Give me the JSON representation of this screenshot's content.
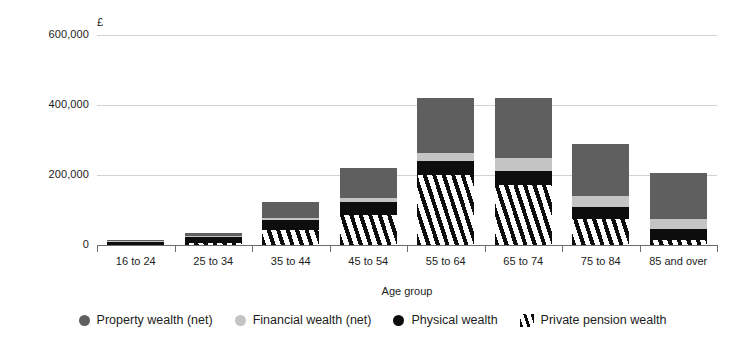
{
  "chart_data": {
    "type": "bar",
    "subtype": "stacked",
    "title": "",
    "xlabel": "Age group",
    "ylabel": "",
    "y_unit": "£",
    "ylim": [
      0,
      620000
    ],
    "yticks": [
      0,
      200000,
      400000,
      600000
    ],
    "ytick_labels": [
      "0",
      "200,000",
      "400,000",
      "600,000"
    ],
    "grid": true,
    "legend_position": "bottom",
    "categories": [
      "16 to 24",
      "25 to 34",
      "35 to 44",
      "45 to 54",
      "55 to 64",
      "65 to 74",
      "75 to 84",
      "85 and over"
    ],
    "series": [
      {
        "name": "Private pension wealth",
        "color": "#0d0d0d",
        "pattern": "diagonal-stripes",
        "values": [
          1000,
          6000,
          43000,
          86000,
          200000,
          172000,
          74000,
          14000
        ]
      },
      {
        "name": "Physical wealth",
        "color": "#0d0d0d",
        "pattern": "solid",
        "values": [
          8000,
          17000,
          29000,
          37000,
          40000,
          40000,
          34000,
          31000
        ]
      },
      {
        "name": "Financial wealth (net)",
        "color": "#c4c4c4",
        "pattern": "solid",
        "values": [
          2000,
          3000,
          5000,
          11000,
          23000,
          37000,
          31000,
          29000
        ]
      },
      {
        "name": "Property wealth (net)",
        "color": "#5f5f5f",
        "pattern": "solid",
        "values": [
          1000,
          8000,
          46000,
          86000,
          157000,
          171000,
          149000,
          131000
        ]
      }
    ],
    "totals": [
      12000,
      34000,
      123000,
      220000,
      420000,
      420000,
      288000,
      205000
    ]
  },
  "axis": {
    "y_unit_symbol": "£",
    "x_title": "Age group"
  },
  "legend": {
    "items": [
      {
        "label": "Property wealth (net)",
        "marker": "circle-dark-gray",
        "color": "#5f5f5f"
      },
      {
        "label": "Financial wealth (net)",
        "marker": "circle-light-gray",
        "color": "#c4c4c4"
      },
      {
        "label": "Physical wealth",
        "marker": "circle-black",
        "color": "#0d0d0d"
      },
      {
        "label": "Private pension wealth",
        "marker": "diagonal-stripes",
        "color": "#0d0d0d"
      }
    ]
  }
}
